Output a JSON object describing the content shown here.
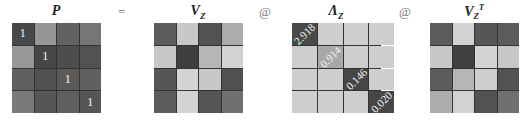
{
  "equation": {
    "operators": [
      "=",
      "@",
      "@"
    ]
  },
  "matrices": [
    {
      "name": "P",
      "label": "P",
      "cells": [
        [
          {
            "g": 72,
            "t": "1"
          },
          {
            "g": 150,
            "t": ""
          },
          {
            "g": 98,
            "t": ""
          },
          {
            "g": 118,
            "t": ""
          }
        ],
        [
          {
            "g": 152,
            "t": ""
          },
          {
            "g": 70,
            "t": "1"
          },
          {
            "g": 76,
            "t": ""
          },
          {
            "g": 82,
            "t": ""
          }
        ],
        [
          {
            "g": 96,
            "t": ""
          },
          {
            "g": 80,
            "t": ""
          },
          {
            "g": 90,
            "t": "1"
          },
          {
            "g": 96,
            "t": ""
          }
        ],
        [
          {
            "g": 122,
            "t": ""
          },
          {
            "g": 86,
            "t": ""
          },
          {
            "g": 96,
            "t": ""
          },
          {
            "g": 86,
            "t": "1"
          }
        ]
      ]
    },
    {
      "name": "V_Z",
      "label": "V",
      "sub": "Z",
      "sup": "",
      "cells": [
        [
          {
            "g": 92,
            "t": ""
          },
          {
            "g": 200,
            "t": ""
          },
          {
            "g": 82,
            "t": ""
          },
          {
            "g": 172,
            "t": ""
          }
        ],
        [
          {
            "g": 200,
            "t": ""
          },
          {
            "g": 62,
            "t": ""
          },
          {
            "g": 182,
            "t": ""
          },
          {
            "g": 210,
            "t": ""
          }
        ],
        [
          {
            "g": 86,
            "t": ""
          },
          {
            "g": 212,
            "t": ""
          },
          {
            "g": 200,
            "t": ""
          },
          {
            "g": 80,
            "t": ""
          }
        ],
        [
          {
            "g": 92,
            "t": ""
          },
          {
            "g": 212,
            "t": ""
          },
          {
            "g": 86,
            "t": ""
          },
          {
            "g": 112,
            "t": ""
          }
        ]
      ]
    },
    {
      "name": "Lambda_Z",
      "label": "Λ",
      "sub": "Z",
      "sup": "",
      "cells": [
        [
          {
            "g": 74,
            "t": "2.918"
          },
          {
            "g": 206,
            "t": ""
          },
          {
            "g": 206,
            "t": ""
          },
          {
            "g": 206,
            "t": ""
          }
        ],
        [
          {
            "g": 206,
            "t": ""
          },
          {
            "g": 168,
            "t": "0.914"
          },
          {
            "g": 206,
            "t": ""
          },
          {
            "g": 206,
            "t": ""
          }
        ],
        [
          {
            "g": 206,
            "t": ""
          },
          {
            "g": 206,
            "t": ""
          },
          {
            "g": 70,
            "t": "0.146"
          },
          {
            "g": 206,
            "t": ""
          }
        ],
        [
          {
            "g": 206,
            "t": ""
          },
          {
            "g": 206,
            "t": ""
          },
          {
            "g": 206,
            "t": ""
          },
          {
            "g": 70,
            "t": "0.020"
          }
        ]
      ]
    },
    {
      "name": "V_Z_T",
      "label": "V",
      "sub": "Z",
      "sup": "T",
      "cells": [
        [
          {
            "g": 92,
            "t": ""
          },
          {
            "g": 210,
            "t": ""
          },
          {
            "g": 86,
            "t": ""
          },
          {
            "g": 92,
            "t": ""
          }
        ],
        [
          {
            "g": 200,
            "t": ""
          },
          {
            "g": 64,
            "t": ""
          },
          {
            "g": 212,
            "t": ""
          },
          {
            "g": 200,
            "t": ""
          }
        ],
        [
          {
            "g": 92,
            "t": ""
          },
          {
            "g": 182,
            "t": ""
          },
          {
            "g": 206,
            "t": ""
          },
          {
            "g": 82,
            "t": ""
          }
        ],
        [
          {
            "g": 172,
            "t": ""
          },
          {
            "g": 210,
            "t": ""
          },
          {
            "g": 82,
            "t": ""
          },
          {
            "g": 112,
            "t": ""
          }
        ]
      ]
    }
  ],
  "eigenvalues": [
    "2.918",
    "0.914",
    "0.146",
    "0.020"
  ]
}
